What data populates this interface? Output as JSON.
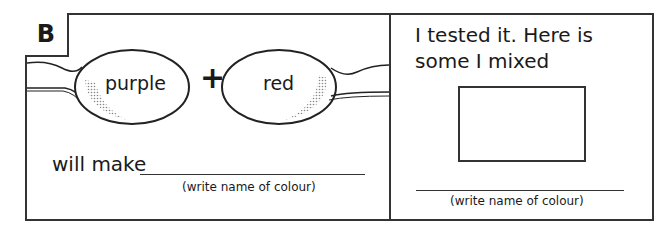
{
  "section_label": "B",
  "left_panel": {
    "spoon1_label": "purple",
    "operator": "+",
    "spoon2_label": "red",
    "prompt": "will make",
    "hint": "(write name of colour)"
  },
  "right_panel": {
    "title": "I tested it. Here is some I mixed",
    "hint": "(write name of colour)"
  }
}
